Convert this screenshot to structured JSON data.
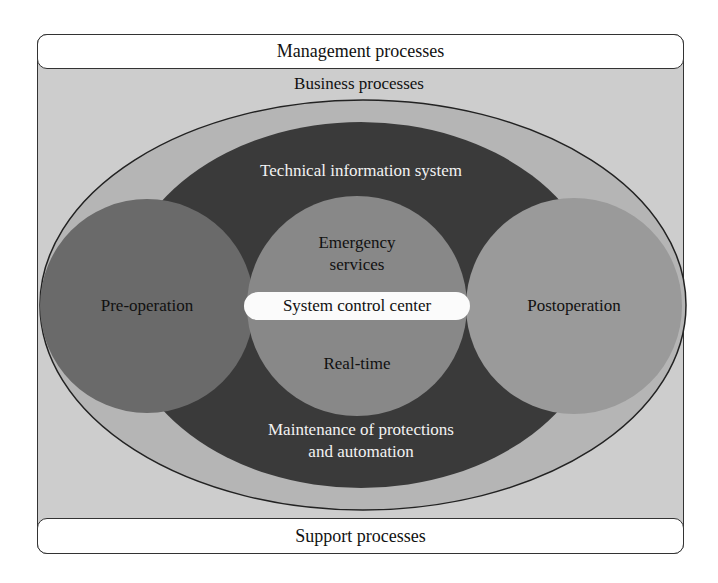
{
  "diagram": {
    "outer_top_band": "Management processes",
    "outer_bottom_band": "Support processes",
    "container_label": "Business processes",
    "ring_ellipse": {
      "label": "Technical information system",
      "bottom_label_line1": "Maintenance of protections",
      "bottom_label_line2": "and automation"
    },
    "circles": [
      {
        "id": "pre-operation",
        "label": "Pre-operation"
      },
      {
        "id": "real-time",
        "label_top_line1": "Emergency",
        "label_top_line2": "services",
        "label_bottom": "Real-time"
      },
      {
        "id": "postoperation",
        "label": "Postoperation"
      }
    ],
    "center_pill": "System control center"
  },
  "colors": {
    "frame_bg": "#cdcdcd",
    "outer_ellipse": "#b5b5b5",
    "dark_ellipse": "#3a3a3a",
    "pre_operation": "#6a6a6a",
    "real_time": "#888888",
    "postoperation": "#9a9a9a",
    "pill": "#fbfbfb"
  }
}
